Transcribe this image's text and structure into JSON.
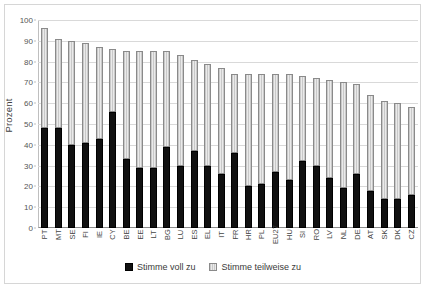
{
  "chart_data": {
    "type": "bar",
    "stacked": true,
    "title": "",
    "subtitle": "",
    "xlabel": "",
    "ylabel": "Prozent",
    "ylim": [
      0,
      100
    ],
    "yticks": [
      0,
      10,
      20,
      30,
      40,
      50,
      60,
      70,
      80,
      90,
      100
    ],
    "grid": true,
    "legend_position": "bottom",
    "categories": [
      "PT",
      "MT",
      "SE",
      "FI",
      "IE",
      "CY",
      "BE",
      "EE",
      "LT",
      "BG",
      "LU",
      "ES",
      "EL",
      "IT",
      "FR",
      "HR",
      "PL",
      "EU27",
      "HU",
      "SI",
      "RO",
      "LV",
      "NL",
      "DE",
      "AT",
      "SK",
      "DK",
      "CZ"
    ],
    "series": [
      {
        "name": "Stimme voll zu",
        "color": "#111111",
        "values": [
          48,
          48,
          40,
          41,
          43,
          56,
          33,
          29,
          29,
          39,
          30,
          37,
          30,
          26,
          36,
          20,
          21,
          27,
          23,
          32,
          30,
          24,
          19,
          26,
          18,
          14,
          14,
          16
        ]
      },
      {
        "name": "Stimme teilweise zu",
        "color": "#d2d2d2",
        "values": [
          48,
          43,
          50,
          48,
          44,
          30,
          52,
          56,
          56,
          46,
          53,
          44,
          49,
          51,
          38,
          54,
          53,
          47,
          51,
          41,
          42,
          47,
          51,
          43,
          46,
          47,
          46,
          42
        ]
      }
    ],
    "totals": [
      96,
      91,
      90,
      89,
      87,
      86,
      85,
      85,
      85,
      85,
      83,
      81,
      79,
      77,
      74,
      74,
      74,
      74,
      74,
      73,
      72,
      71,
      70,
      69,
      64,
      61,
      60,
      58
    ]
  },
  "axis": {
    "y_title": "Prozent"
  },
  "legend": {
    "items": [
      {
        "label": "Stimme voll zu"
      },
      {
        "label": "Stimme teilweise zu"
      }
    ]
  }
}
